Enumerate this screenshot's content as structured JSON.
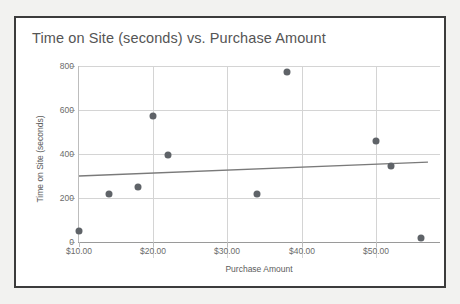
{
  "chart_data": {
    "type": "scatter",
    "title": "Time on Site (seconds) vs. Purchase Amount",
    "xlabel": "Purchase Amount",
    "ylabel": "Time on Site (seconds)",
    "xlim": [
      8,
      58
    ],
    "ylim": [
      0,
      830
    ],
    "grid": true,
    "legend": "none",
    "xticks": [
      {
        "value": 10,
        "label": "$10.00"
      },
      {
        "value": 20,
        "label": "$20.00"
      },
      {
        "value": 30,
        "label": "$30.00"
      },
      {
        "value": 40,
        "label": "$40.00"
      },
      {
        "value": 50,
        "label": "$50.00"
      }
    ],
    "yticks": [
      {
        "value": 0,
        "label": "0"
      },
      {
        "value": 200,
        "label": "200"
      },
      {
        "value": 400,
        "label": "400"
      },
      {
        "value": 600,
        "label": "600"
      },
      {
        "value": 800,
        "label": "800"
      }
    ],
    "series": [
      {
        "name": "Time on Site vs Purchase Amount",
        "marker_color": "#5f6368",
        "x": [
          10,
          14,
          18,
          20,
          22,
          34,
          38,
          50,
          52,
          56
        ],
        "y": [
          52,
          218,
          248,
          572,
          396,
          218,
          775,
          458,
          345,
          18
        ]
      }
    ],
    "trendline": {
      "name": "linear trendline",
      "color": "#7a7a7a",
      "x_start": 10,
      "y_start": 300,
      "x_end": 57,
      "y_end": 363
    }
  },
  "colors": {
    "frame": "#3c3c3c",
    "page_background": "#f2f2f0",
    "plot_background": "#ffffff",
    "gridline": "#d4d4d4",
    "axis": "#9a9a9a",
    "title_text": "#555555",
    "tick_text": "#6b6b6b",
    "marker": "#5f6368",
    "trendline": "#7a7a7a"
  }
}
